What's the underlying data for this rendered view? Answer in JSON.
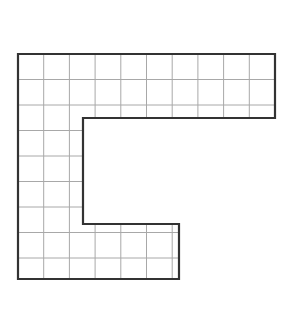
{
  "figure": {
    "colors": {
      "background": "#ffffff",
      "grid_line": "#a8a8a8",
      "outline": "#333333"
    },
    "grid": {
      "origin_x": 18,
      "origin_y": 54,
      "cell_w": 25.7,
      "cell_h": 25.5,
      "columns": 10,
      "rows": 9
    },
    "outline_points": [
      [
        18,
        54
      ],
      [
        275,
        54
      ],
      [
        275,
        118
      ],
      [
        83,
        118
      ],
      [
        83,
        224
      ],
      [
        179,
        224
      ],
      [
        179,
        279
      ],
      [
        18,
        279
      ]
    ],
    "clip_regions": [
      {
        "name": "top-band",
        "x": 18,
        "y": 54,
        "w": 257,
        "h": 64
      },
      {
        "name": "left-column",
        "x": 18,
        "y": 118,
        "w": 65,
        "h": 106
      },
      {
        "name": "bottom-band",
        "x": 18,
        "y": 224,
        "w": 161,
        "h": 55
      }
    ]
  }
}
